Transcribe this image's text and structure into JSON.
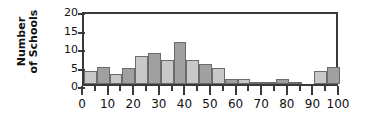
{
  "chart_data": {
    "type": "bar",
    "title": "",
    "xlabel": "",
    "ylabel": "Number of Schools",
    "ylabel_line1": "Number",
    "ylabel_line2": "of Schools",
    "ylim": [
      0,
      20
    ],
    "xlim": [
      0,
      100
    ],
    "yticks": [
      0,
      5,
      10,
      15,
      20
    ],
    "ytick_labels": [
      "0",
      "5",
      "10",
      "15",
      "20"
    ],
    "xticks": [
      0,
      10,
      20,
      30,
      40,
      50,
      60,
      70,
      80,
      90,
      100
    ],
    "xtick_labels": [
      "0",
      "10",
      "20",
      "30",
      "40",
      "50",
      "60",
      "70",
      "80",
      "90",
      "100"
    ],
    "xminor_ticks": [
      5,
      15,
      25,
      35,
      45,
      55,
      65,
      75,
      85,
      95
    ],
    "bin_width": 5,
    "grid": false,
    "legend": "none",
    "bin_edges": [
      0,
      5,
      10,
      15,
      20,
      25,
      30,
      35,
      40,
      45,
      50,
      55,
      60,
      65,
      70,
      75,
      80,
      85,
      90,
      95,
      100
    ],
    "bins": [
      {
        "x0": 0,
        "x1": 5,
        "value": 3.5,
        "shade": "light"
      },
      {
        "x0": 5,
        "x1": 10,
        "value": 4.5,
        "shade": "dark"
      },
      {
        "x0": 10,
        "x1": 15,
        "value": 2.7,
        "shade": "light"
      },
      {
        "x0": 15,
        "x1": 20,
        "value": 4.4,
        "shade": "dark"
      },
      {
        "x0": 20,
        "x1": 25,
        "value": 7.5,
        "shade": "light"
      },
      {
        "x0": 25,
        "x1": 30,
        "value": 8.4,
        "shade": "dark"
      },
      {
        "x0": 30,
        "x1": 35,
        "value": 6.5,
        "shade": "light"
      },
      {
        "x0": 35,
        "x1": 40,
        "value": 11.4,
        "shade": "dark"
      },
      {
        "x0": 40,
        "x1": 45,
        "value": 6.5,
        "shade": "light"
      },
      {
        "x0": 45,
        "x1": 50,
        "value": 5.4,
        "shade": "dark"
      },
      {
        "x0": 50,
        "x1": 55,
        "value": 4.4,
        "shade": "light"
      },
      {
        "x0": 55,
        "x1": 60,
        "value": 1.4,
        "shade": "dark"
      },
      {
        "x0": 60,
        "x1": 65,
        "value": 1.4,
        "shade": "light"
      },
      {
        "x0": 65,
        "x1": 70,
        "value": 0.4,
        "shade": "dark"
      },
      {
        "x0": 70,
        "x1": 75,
        "value": 0.4,
        "shade": "light"
      },
      {
        "x0": 75,
        "x1": 80,
        "value": 1.4,
        "shade": "dark"
      },
      {
        "x0": 80,
        "x1": 85,
        "value": 0.4,
        "shade": "light"
      },
      {
        "x0": 85,
        "x1": 90,
        "value": 0.0,
        "shade": "dark"
      },
      {
        "x0": 90,
        "x1": 95,
        "value": 3.5,
        "shade": "light"
      },
      {
        "x0": 95,
        "x1": 100,
        "value": 4.5,
        "shade": "dark"
      }
    ],
    "colors": {
      "bar_light": "#c8c8c8",
      "bar_dark": "#a0a0a0",
      "bar_edge": "#6b6b6b",
      "axis": "#3a3a3a",
      "text": "#111111",
      "background": "#ffffff"
    }
  }
}
